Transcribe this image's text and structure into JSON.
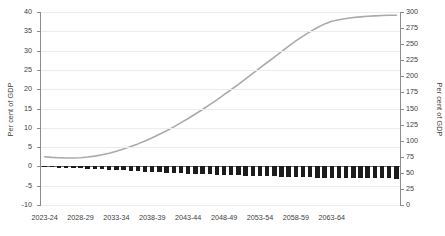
{
  "chart_data": {
    "type": "bar",
    "title": "",
    "xlabel": "",
    "ylabel": "Per cent of GDP",
    "y2label": "Per cent of GDP",
    "grid": true,
    "legend": false,
    "ylim": [
      -10,
      40
    ],
    "y2lim": [
      0,
      300
    ],
    "yticks": [
      40,
      35,
      30,
      25,
      20,
      15,
      10,
      5,
      0,
      -5,
      -10
    ],
    "y2ticks": [
      300,
      275,
      250,
      225,
      200,
      175,
      150,
      125,
      100,
      75,
      50,
      25,
      0
    ],
    "xtick_labels": [
      "2023-24",
      "2028-29",
      "2033-34",
      "2038-39",
      "2043-44",
      "2048-49",
      "2053-54",
      "2058-59",
      "2063-64"
    ],
    "xtick_indices": [
      0,
      5,
      10,
      15,
      20,
      25,
      30,
      35,
      40
    ],
    "categories": [
      "2023-24",
      "2024-25",
      "2025-26",
      "2026-27",
      "2027-28",
      "2028-29",
      "2029-30",
      "2030-31",
      "2031-32",
      "2032-33",
      "2033-34",
      "2034-35",
      "2035-36",
      "2036-37",
      "2037-38",
      "2038-39",
      "2039-40",
      "2040-41",
      "2041-42",
      "2042-43",
      "2043-44",
      "2044-45",
      "2045-46",
      "2046-47",
      "2047-48",
      "2048-49",
      "2049-50",
      "2050-51",
      "2051-52",
      "2052-53",
      "2053-54",
      "2054-55",
      "2055-56",
      "2056-57",
      "2057-58",
      "2058-59",
      "2059-60",
      "2060-61",
      "2061-62",
      "2062-63",
      "2063-64",
      "2064-65",
      "2065-66",
      "2066-67",
      "2067-68",
      "2068-69",
      "2069-70",
      "2070-71",
      "2071-72",
      "2072-73"
    ],
    "series": [
      {
        "name": "Primary balance",
        "type": "bar",
        "axis": "left",
        "color": "#1c1c1c",
        "unit": "Per cent of GDP",
        "values": [
          -0.2,
          -0.25,
          -0.3,
          -0.35,
          -0.4,
          -0.45,
          -0.55,
          -0.65,
          -0.75,
          -0.85,
          -0.95,
          -1.05,
          -1.15,
          -1.25,
          -1.35,
          -1.45,
          -1.55,
          -1.62,
          -1.7,
          -1.78,
          -1.85,
          -1.92,
          -2.0,
          -2.05,
          -2.12,
          -2.18,
          -2.24,
          -2.3,
          -2.36,
          -2.42,
          -2.48,
          -2.54,
          -2.6,
          -2.65,
          -2.7,
          -2.75,
          -2.8,
          -2.85,
          -2.88,
          -2.92,
          -2.95,
          -2.98,
          -3.0,
          -3.02,
          -3.05,
          -3.07,
          -3.09,
          -3.11,
          -3.12,
          -3.14
        ]
      },
      {
        "name": "Public debt",
        "type": "line",
        "axis": "right",
        "color": "#aaaaaa",
        "unit": "Per cent of GDP",
        "values": [
          75,
          74,
          73.5,
          73,
          73,
          73.5,
          74.5,
          76,
          78,
          80.5,
          83.5,
          87,
          91,
          95,
          99.5,
          104.5,
          110,
          115.5,
          121.5,
          128,
          134.5,
          141.5,
          148.5,
          156,
          163.5,
          171.5,
          179.5,
          187.5,
          196,
          204.5,
          213,
          221.5,
          230,
          238.5,
          247,
          255,
          262.5,
          269.5,
          276,
          281.5,
          285.5,
          288,
          290,
          291.5,
          292.5,
          293.5,
          294,
          294.5,
          295,
          295
        ]
      }
    ]
  }
}
